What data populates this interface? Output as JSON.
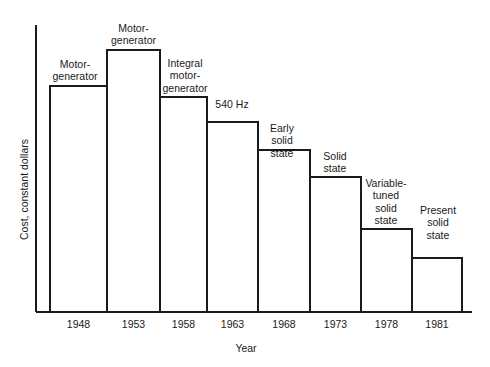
{
  "chart_data": {
    "type": "bar",
    "title": "",
    "subtitle": "",
    "xlabel": "Year",
    "ylabel": "Cost, constant dollars",
    "grid": false,
    "legend": "none",
    "categories": [
      "1948",
      "1953",
      "1958",
      "1963",
      "1968",
      "1973",
      "1978",
      "1981"
    ],
    "values": [
      78.8,
      91.3,
      74.9,
      66.2,
      56.4,
      47.0,
      28.9,
      18.8
    ],
    "ylim": [
      0,
      100
    ],
    "y_axis_ticks": [],
    "bar_annotations": [
      "Motor-\ngenerator",
      "Motor-\ngenerator",
      "Integral\nmotor-\ngenerator",
      "540 Hz",
      "Early\nsolid\nstate",
      "Solid\nstate",
      "Variable-\ntuned\nsolid\nstate",
      "Present\nsolid\nstate"
    ],
    "series": [
      {
        "name": "Cost, constant dollars",
        "values": [
          78.8,
          91.3,
          74.9,
          66.2,
          56.4,
          47.0,
          28.9,
          18.8
        ]
      }
    ],
    "colors": {
      "bar_fill": "#ffffff",
      "bar_stroke": "#1a1a1a",
      "axis": "#1a1a1a",
      "text": "#1a1a1a",
      "background": "#ffffff"
    }
  },
  "geometry": {
    "plot_left": 36,
    "plot_right": 472,
    "plot_bottom": 312,
    "plot_top": 25,
    "bar_edges": [
      50,
      107,
      160,
      207,
      258,
      310,
      361,
      412,
      462
    ],
    "bar_tops": [
      86,
      50,
      97,
      122,
      150,
      177,
      229,
      258
    ],
    "label_boxes": [
      {
        "left": 40,
        "top": 58,
        "width": 70
      },
      {
        "left": 97,
        "top": 22,
        "width": 73
      },
      {
        "left": 150,
        "top": 57,
        "width": 70
      },
      {
        "left": 203,
        "top": 98,
        "width": 58
      },
      {
        "left": 252,
        "top": 122,
        "width": 60
      },
      {
        "left": 305,
        "top": 150,
        "width": 60
      },
      {
        "left": 355,
        "top": 177,
        "width": 62
      },
      {
        "left": 408,
        "top": 204,
        "width": 60
      }
    ],
    "tick_label_y": 318,
    "x_title": {
      "left": 196,
      "top": 342
    },
    "y_title": {
      "left": 18,
      "top": 240
    }
  }
}
